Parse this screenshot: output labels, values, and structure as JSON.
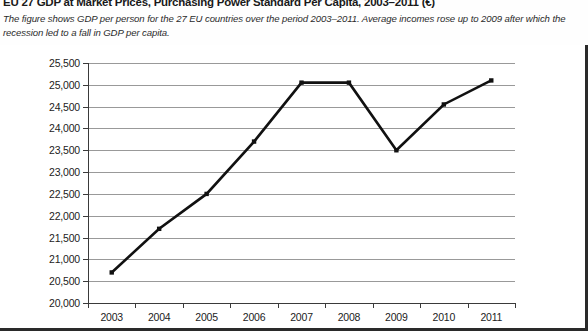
{
  "header": {
    "title": "EU 27 GDP at Market Prices, Purchasing Power Standard Per Capita, 2003–2011 (€)",
    "subtitle": "The figure shows GDP per person for the 27 EU countries over the period 2003–2011. Average incomes rose up to 2009 after which the recession led to a fall in GDP per capita."
  },
  "chart_data": {
    "type": "line",
    "title": "EU 27 GDP at Market Prices, Purchasing Power Standard Per Capita, 2003–2011 (€)",
    "xlabel": "",
    "ylabel": "",
    "categories": [
      "2003",
      "2004",
      "2005",
      "2006",
      "2007",
      "2008",
      "2009",
      "2010",
      "2011"
    ],
    "x": [
      2003,
      2004,
      2005,
      2006,
      2007,
      2008,
      2009,
      2010,
      2011
    ],
    "values": [
      20700,
      21700,
      22500,
      23700,
      25050,
      25050,
      23500,
      24550,
      25100
    ],
    "series": [
      {
        "name": "GDP per capita (PPS, €)",
        "values": [
          20700,
          21700,
          22500,
          23700,
          25050,
          25050,
          23500,
          24550,
          25100
        ]
      }
    ],
    "ylim": [
      20000,
      25500
    ],
    "ytick_values": [
      20000,
      20500,
      21000,
      21500,
      22000,
      22500,
      23000,
      23500,
      24000,
      24500,
      25000,
      25500
    ],
    "ytick_labels": [
      "20,000",
      "20,500",
      "21,000",
      "21,500",
      "22,000",
      "22,500",
      "23,000",
      "23,500",
      "24,000",
      "24,500",
      "25,000",
      "25,500"
    ],
    "xtick_labels": [
      "2003",
      "2004",
      "2005",
      "2006",
      "2007",
      "2008",
      "2009",
      "2010",
      "2011"
    ],
    "grid": true,
    "legend": false,
    "line_color": "#111111",
    "marker": "square",
    "gridline_color": "#999999",
    "background_color": "#ffffff"
  },
  "style": {
    "frame_border_color": "#2a2a2a",
    "axis_color": "#3a3a3a",
    "text_color": "#1c1c1c"
  }
}
